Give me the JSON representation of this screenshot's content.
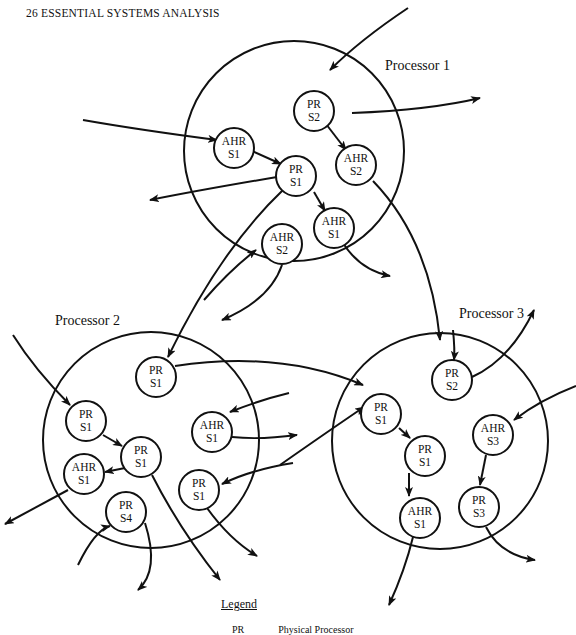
{
  "page": {
    "header": "26  ESSENTIAL SYSTEMS ANALYSIS"
  },
  "diagram": {
    "processors": [
      {
        "label": "Processor 1"
      },
      {
        "label": "Processor 2"
      },
      {
        "label": "Processor 3"
      }
    ],
    "nodes": [
      {
        "id": "p1-pr-s2",
        "processor": 1,
        "line1": "PR",
        "line2": "S2"
      },
      {
        "id": "p1-ahr-s1",
        "processor": 1,
        "line1": "AHR",
        "line2": "S1"
      },
      {
        "id": "p1-ahr-s2a",
        "processor": 1,
        "line1": "AHR",
        "line2": "S2"
      },
      {
        "id": "p1-pr-s1",
        "processor": 1,
        "line1": "PR",
        "line2": "S1"
      },
      {
        "id": "p1-ahr-s1b",
        "processor": 1,
        "line1": "AHR",
        "line2": "S1"
      },
      {
        "id": "p1-ahr-s2b",
        "processor": 1,
        "line1": "AHR",
        "line2": "S2"
      },
      {
        "id": "p2-pr-s1a",
        "processor": 2,
        "line1": "PR",
        "line2": "S1"
      },
      {
        "id": "p2-pr-s1b",
        "processor": 2,
        "line1": "PR",
        "line2": "S1"
      },
      {
        "id": "p2-ahr-s1a",
        "processor": 2,
        "line1": "AHR",
        "line2": "S1"
      },
      {
        "id": "p2-pr-s1c",
        "processor": 2,
        "line1": "PR",
        "line2": "S1"
      },
      {
        "id": "p2-ahr-s1b",
        "processor": 2,
        "line1": "AHR",
        "line2": "S1"
      },
      {
        "id": "p2-pr-s1d",
        "processor": 2,
        "line1": "PR",
        "line2": "S1"
      },
      {
        "id": "p2-pr-s4",
        "processor": 2,
        "line1": "PR",
        "line2": "S4"
      },
      {
        "id": "p3-pr-s2",
        "processor": 3,
        "line1": "PR",
        "line2": "S2"
      },
      {
        "id": "p3-pr-s1a",
        "processor": 3,
        "line1": "PR",
        "line2": "S1"
      },
      {
        "id": "p3-ahr-s3",
        "processor": 3,
        "line1": "AHR",
        "line2": "S3"
      },
      {
        "id": "p3-pr-s1b",
        "processor": 3,
        "line1": "PR",
        "line2": "S1"
      },
      {
        "id": "p3-pr-s3",
        "processor": 3,
        "line1": "PR",
        "line2": "S3"
      },
      {
        "id": "p3-ahr-s1",
        "processor": 3,
        "line1": "AHR",
        "line2": "S1"
      }
    ]
  },
  "legend": {
    "title": "Legend",
    "entries": [
      {
        "abbr": "PR",
        "meaning": "Physical Processor"
      }
    ]
  }
}
